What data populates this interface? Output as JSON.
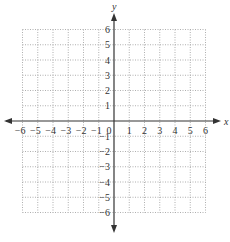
{
  "chart_data": {
    "type": "scatter",
    "title": "",
    "xlabel": "x",
    "ylabel": "y",
    "xlim": [
      -6,
      6
    ],
    "ylim": [
      -6,
      6
    ],
    "grid": true,
    "grid_style": "dotted",
    "x_ticks": [
      -6,
      -5,
      -4,
      -3,
      -2,
      -1,
      0,
      1,
      2,
      3,
      4,
      5,
      6
    ],
    "y_ticks": [
      -6,
      -5,
      -4,
      -3,
      -2,
      -1,
      1,
      2,
      3,
      4,
      5,
      6
    ],
    "x_tick_labels": [
      "−6",
      "−5",
      "−4",
      "−3",
      "−2",
      "−1",
      "0",
      "1",
      "2",
      "3",
      "4",
      "5",
      "6"
    ],
    "y_tick_labels": [
      "6",
      "5",
      "4",
      "3",
      "2",
      "1",
      "−1",
      "−2",
      "−3",
      "−4",
      "−5",
      "−6"
    ],
    "series": [],
    "axes_arrows": true
  },
  "axes": {
    "x_label": "x",
    "y_label": "y",
    "origin_label": "0"
  },
  "colors": {
    "axis": "#333333",
    "grid": "#9a9a9a",
    "text": "#333333"
  }
}
